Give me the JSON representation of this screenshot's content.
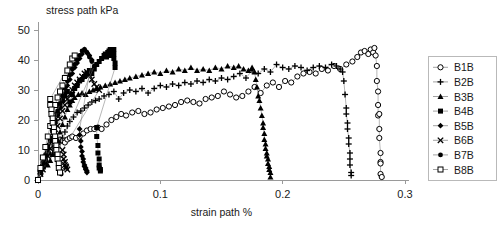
{
  "chart_data": {
    "type": "scatter",
    "title": "stress path kPa",
    "xlabel": "strain path %",
    "ylabel": "stress path kPa",
    "xlim": [
      0,
      0.3
    ],
    "ylim": [
      0,
      50
    ],
    "xticks": [
      "0",
      "0.1",
      "0.2",
      "0.3"
    ],
    "xtick_values": [
      0,
      0.1,
      0.2,
      0.3
    ],
    "yticks": [
      "0",
      "10",
      "20",
      "30",
      "40",
      "50"
    ],
    "ytick_values": [
      0,
      10,
      20,
      30,
      40,
      50
    ],
    "grid": false,
    "legend_position": "right",
    "series": [
      {
        "name": "B1B",
        "marker": "open-circle",
        "x": [
          0.0,
          0.002,
          0.004,
          0.006,
          0.008,
          0.01,
          0.012,
          0.014,
          0.016,
          0.018,
          0.02,
          0.022,
          0.024,
          0.026,
          0.028,
          0.031,
          0.034,
          0.037,
          0.04,
          0.043,
          0.046,
          0.049,
          0.052,
          0.056,
          0.06,
          0.064,
          0.068,
          0.072,
          0.077,
          0.082,
          0.087,
          0.092,
          0.097,
          0.102,
          0.107,
          0.112,
          0.117,
          0.122,
          0.127,
          0.132,
          0.137,
          0.142,
          0.147,
          0.152,
          0.157,
          0.162,
          0.167,
          0.172,
          0.177,
          0.182,
          0.187,
          0.192,
          0.197,
          0.202,
          0.207,
          0.212,
          0.217,
          0.222,
          0.227,
          0.232,
          0.237,
          0.242,
          0.247,
          0.252,
          0.257,
          0.261,
          0.264,
          0.267,
          0.27,
          0.272,
          0.274,
          0.275,
          0.276,
          0.277,
          0.277,
          0.278,
          0.278,
          0.278,
          0.279,
          0.279,
          0.279,
          0.28,
          0.28,
          0.28,
          0.28,
          0.281
        ],
        "y": [
          0.0,
          2.0,
          4.0,
          6.5,
          9.0,
          11.0,
          12.5,
          12.0,
          12.5,
          13.5,
          13.0,
          12.5,
          13.5,
          14.0,
          14.5,
          14.0,
          14.5,
          15.5,
          16.5,
          17.0,
          17.0,
          17.5,
          17.0,
          18.5,
          20.0,
          21.0,
          22.0,
          21.5,
          22.5,
          23.0,
          22.0,
          22.5,
          23.5,
          24.0,
          24.5,
          25.0,
          26.0,
          26.5,
          26.0,
          25.5,
          27.0,
          27.5,
          28.0,
          29.5,
          28.5,
          27.5,
          28.0,
          29.5,
          31.0,
          29.0,
          31.5,
          32.5,
          31.0,
          33.0,
          32.5,
          34.5,
          35.5,
          36.0,
          35.5,
          37.0,
          36.5,
          38.0,
          37.0,
          38.5,
          39.5,
          41.0,
          42.5,
          43.0,
          42.0,
          43.5,
          42.5,
          44.0,
          41.5,
          38.0,
          33.0,
          29.5,
          25.0,
          21.5,
          22.0,
          17.0,
          14.0,
          9.0,
          6.0,
          5.5,
          2.0,
          1.0
        ]
      },
      {
        "name": "B2B",
        "marker": "plus",
        "x": [
          0.0,
          0.002,
          0.004,
          0.006,
          0.008,
          0.01,
          0.012,
          0.014,
          0.016,
          0.018,
          0.02,
          0.022,
          0.024,
          0.026,
          0.029,
          0.032,
          0.035,
          0.038,
          0.041,
          0.044,
          0.047,
          0.05,
          0.054,
          0.058,
          0.062,
          0.066,
          0.07,
          0.075,
          0.08,
          0.085,
          0.09,
          0.095,
          0.1,
          0.105,
          0.11,
          0.115,
          0.12,
          0.125,
          0.13,
          0.135,
          0.14,
          0.145,
          0.15,
          0.155,
          0.16,
          0.165,
          0.17,
          0.175,
          0.18,
          0.185,
          0.19,
          0.195,
          0.2,
          0.205,
          0.21,
          0.215,
          0.22,
          0.225,
          0.23,
          0.235,
          0.24,
          0.244,
          0.247,
          0.249,
          0.25,
          0.251,
          0.252,
          0.252,
          0.253,
          0.253,
          0.254,
          0.254,
          0.255,
          0.255,
          0.255,
          0.256,
          0.256
        ],
        "y": [
          0.0,
          3.0,
          5.0,
          7.5,
          9.0,
          8.5,
          9.0,
          10.0,
          11.0,
          12.5,
          14.0,
          16.0,
          18.0,
          19.5,
          21.0,
          22.5,
          23.0,
          24.0,
          25.0,
          26.0,
          26.5,
          27.0,
          28.0,
          28.5,
          29.5,
          27.0,
          29.0,
          30.0,
          29.5,
          30.5,
          29.0,
          30.5,
          31.5,
          31.0,
          32.0,
          31.5,
          32.5,
          32.0,
          33.0,
          32.5,
          33.5,
          33.0,
          34.0,
          33.5,
          34.5,
          35.5,
          34.0,
          36.5,
          35.5,
          37.0,
          36.0,
          38.5,
          37.5,
          37.0,
          38.0,
          37.5,
          36.5,
          37.5,
          38.0,
          37.5,
          38.5,
          38.0,
          37.0,
          36.0,
          33.0,
          28.5,
          24.0,
          22.0,
          19.0,
          17.0,
          14.0,
          12.0,
          9.0,
          7.0,
          5.0,
          2.5,
          1.5
        ]
      },
      {
        "name": "B3B",
        "marker": "filled-triangle",
        "x": [
          0.0,
          0.002,
          0.004,
          0.006,
          0.008,
          0.01,
          0.012,
          0.014,
          0.016,
          0.018,
          0.02,
          0.022,
          0.024,
          0.026,
          0.028,
          0.03,
          0.033,
          0.036,
          0.039,
          0.042,
          0.045,
          0.048,
          0.051,
          0.055,
          0.059,
          0.063,
          0.067,
          0.071,
          0.075,
          0.08,
          0.085,
          0.09,
          0.095,
          0.1,
          0.105,
          0.11,
          0.115,
          0.12,
          0.125,
          0.13,
          0.135,
          0.14,
          0.145,
          0.15,
          0.155,
          0.16,
          0.164,
          0.168,
          0.172,
          0.175,
          0.177,
          0.178,
          0.179,
          0.18,
          0.181,
          0.182,
          0.183,
          0.184,
          0.184,
          0.185,
          0.185,
          0.186,
          0.186,
          0.187,
          0.187,
          0.188,
          0.188,
          0.189,
          0.189,
          0.19,
          0.19
        ],
        "y": [
          0.0,
          3.0,
          5.5,
          6.0,
          5.0,
          6.5,
          8.5,
          11.0,
          13.5,
          16.0,
          18.5,
          21.0,
          23.5,
          25.0,
          26.5,
          27.5,
          28.5,
          29.0,
          28.5,
          29.5,
          30.0,
          30.5,
          31.0,
          31.5,
          32.0,
          32.5,
          33.0,
          33.5,
          34.0,
          34.5,
          35.0,
          35.5,
          36.0,
          35.5,
          36.5,
          36.0,
          37.0,
          36.5,
          37.5,
          36.5,
          37.0,
          36.5,
          37.5,
          37.0,
          38.0,
          37.5,
          38.0,
          37.0,
          36.5,
          37.5,
          36.0,
          33.5,
          31.0,
          28.0,
          26.5,
          24.0,
          21.5,
          19.0,
          17.5,
          15.5,
          13.5,
          12.0,
          10.5,
          9.0,
          8.0,
          7.0,
          5.5,
          4.5,
          3.5,
          2.5,
          1.0
        ]
      },
      {
        "name": "B4B",
        "marker": "filled-square",
        "x": [
          0.0,
          0.002,
          0.004,
          0.006,
          0.008,
          0.01,
          0.012,
          0.014,
          0.016,
          0.018,
          0.02,
          0.022,
          0.024,
          0.026,
          0.028,
          0.03,
          0.032,
          0.034,
          0.036,
          0.038,
          0.04,
          0.042,
          0.044,
          0.046,
          0.048,
          0.05,
          0.052,
          0.054,
          0.055,
          0.056,
          0.057,
          0.058,
          0.058,
          0.059,
          0.059,
          0.06,
          0.06,
          0.061,
          0.061,
          0.062,
          0.062,
          0.062,
          0.063,
          0.063,
          0.048,
          0.048,
          0.049,
          0.049,
          0.05,
          0.05,
          0.05,
          0.051,
          0.051
        ],
        "y": [
          0.0,
          2.5,
          4.5,
          7.0,
          10.0,
          13.0,
          16.5,
          19.5,
          22.0,
          24.5,
          26.5,
          28.0,
          29.5,
          26.0,
          28.5,
          30.5,
          31.5,
          33.0,
          33.5,
          34.5,
          35.5,
          36.5,
          35.5,
          37.0,
          38.5,
          39.5,
          40.5,
          41.5,
          42.0,
          41.0,
          42.5,
          43.0,
          41.5,
          43.5,
          42.0,
          43.5,
          42.5,
          43.0,
          41.5,
          43.5,
          42.0,
          40.5,
          39.0,
          37.5,
          17.5,
          14.5,
          11.5,
          9.0,
          7.0,
          5.0,
          4.0,
          3.5,
          3.0
        ]
      },
      {
        "name": "B5B",
        "marker": "filled-diamond",
        "x": [
          0.0,
          0.002,
          0.004,
          0.006,
          0.008,
          0.01,
          0.012,
          0.014,
          0.016,
          0.018,
          0.02,
          0.022,
          0.024,
          0.026,
          0.028,
          0.03,
          0.032,
          0.034,
          0.036,
          0.038,
          0.04,
          0.042,
          0.044,
          0.034,
          0.034,
          0.035,
          0.035,
          0.036,
          0.036,
          0.037,
          0.037,
          0.038,
          0.038,
          0.039,
          0.039,
          0.04,
          0.04
        ],
        "y": [
          0.0,
          3.5,
          6.0,
          8.5,
          11.5,
          14.0,
          16.5,
          19.0,
          21.5,
          24.0,
          26.5,
          29.0,
          31.5,
          33.5,
          35.5,
          37.5,
          39.0,
          40.5,
          42.0,
          43.5,
          42.5,
          41.5,
          40.0,
          17.0,
          15.0,
          13.0,
          11.0,
          9.5,
          8.0,
          7.0,
          6.0,
          5.0,
          4.5,
          4.0,
          3.5,
          3.0,
          2.5
        ]
      },
      {
        "name": "B6B",
        "marker": "x-cross",
        "x": [
          0.0,
          0.002,
          0.004,
          0.006,
          0.008,
          0.01,
          0.012,
          0.014,
          0.016,
          0.018,
          0.02,
          0.022,
          0.024,
          0.026,
          0.028,
          0.03,
          0.032,
          0.034,
          0.036,
          0.038,
          0.04,
          0.042,
          0.044,
          0.046,
          0.048,
          0.05,
          0.02,
          0.021,
          0.021,
          0.022,
          0.022,
          0.023,
          0.023,
          0.024
        ],
        "y": [
          0.0,
          2.0,
          3.5,
          5.5,
          8.0,
          10.5,
          13.0,
          15.5,
          18.0,
          20.5,
          23.0,
          25.0,
          27.0,
          28.5,
          30.0,
          31.5,
          32.5,
          33.5,
          34.5,
          35.5,
          36.0,
          35.0,
          33.5,
          32.0,
          31.0,
          30.0,
          10.0,
          8.5,
          7.0,
          6.0,
          5.0,
          4.5,
          4.0,
          3.5
        ]
      },
      {
        "name": "B7B",
        "marker": "filled-circle",
        "x": [
          0.0,
          0.002,
          0.004,
          0.006,
          0.008,
          0.01,
          0.012,
          0.014,
          0.016,
          0.018,
          0.02,
          0.022,
          0.024,
          0.026,
          0.028,
          0.03,
          0.032,
          0.034,
          0.036,
          0.038,
          0.04,
          0.042,
          0.044,
          0.046,
          0.015,
          0.016,
          0.016,
          0.017,
          0.017,
          0.018,
          0.018,
          0.019
        ],
        "y": [
          0.0,
          3.0,
          5.5,
          8.0,
          11.0,
          14.0,
          17.0,
          20.0,
          23.0,
          25.5,
          28.0,
          30.5,
          33.0,
          35.0,
          37.0,
          38.5,
          40.0,
          41.5,
          43.0,
          43.5,
          42.5,
          41.0,
          39.5,
          38.0,
          8.5,
          7.5,
          6.5,
          5.5,
          4.5,
          3.5,
          2.5,
          2.0
        ]
      },
      {
        "name": "B8B",
        "marker": "open-square",
        "x": [
          0.0,
          0.002,
          0.004,
          0.006,
          0.008,
          0.01,
          0.012,
          0.014,
          0.016,
          0.018,
          0.02,
          0.022,
          0.024,
          0.026,
          0.028,
          0.03,
          0.01,
          0.01,
          0.011,
          0.011,
          0.012,
          0.012,
          0.013,
          0.013,
          0.014,
          0.014,
          0.015,
          0.015,
          0.016,
          0.016,
          0.017,
          0.017,
          0.018
        ],
        "y": [
          0.0,
          4.0,
          7.5,
          11.0,
          14.5,
          18.0,
          21.5,
          25.0,
          27.5,
          29.5,
          31.5,
          34.0,
          36.5,
          38.5,
          40.5,
          41.5,
          27.0,
          25.0,
          23.5,
          22.0,
          20.5,
          19.0,
          17.5,
          16.0,
          14.5,
          13.0,
          11.5,
          10.0,
          8.5,
          7.0,
          5.5,
          4.0,
          2.5
        ]
      }
    ]
  },
  "legend": {
    "entries": [
      {
        "label": "B1B",
        "marker": "open-circle"
      },
      {
        "label": "B2B",
        "marker": "plus"
      },
      {
        "label": "B3B",
        "marker": "filled-triangle"
      },
      {
        "label": "B4B",
        "marker": "filled-square"
      },
      {
        "label": "B5B",
        "marker": "filled-diamond"
      },
      {
        "label": "B6B",
        "marker": "x-cross"
      },
      {
        "label": "B7B",
        "marker": "filled-circle"
      },
      {
        "label": "B8B",
        "marker": "open-square"
      }
    ]
  }
}
